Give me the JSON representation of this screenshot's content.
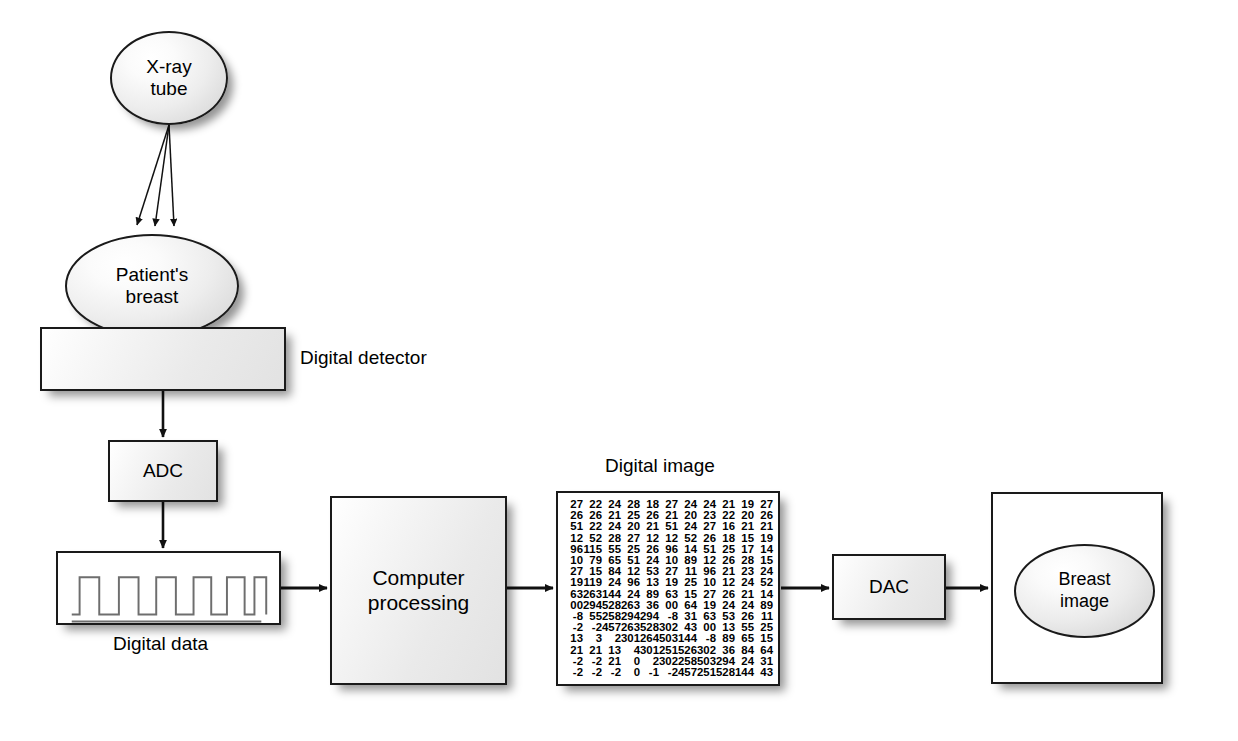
{
  "diagram": {
    "nodes": {
      "xray_tube": "X-ray\ntube",
      "patient_breast": "Patient's\nbreast",
      "digital_detector": "",
      "adc": "ADC",
      "computer_processing": "Computer\nprocessing",
      "dac": "DAC",
      "breast_image": "Breast\nimage"
    },
    "labels": {
      "digital_detector": "Digital detector",
      "digital_data": "Digital data",
      "digital_image": "Digital image"
    },
    "colors": {
      "stroke": "#1a1a1a",
      "fill_light": "#ffffff",
      "fill_grey": "#e2e2e2",
      "text": "#000000",
      "shadow": "rgba(0,0,0,0.42)"
    },
    "waveform": {
      "pulses": 7,
      "has_baseline": true
    },
    "beams": {
      "count": 3,
      "description": "three x-ray beams from tube to breast"
    }
  },
  "chart_data": {
    "type": "table",
    "title": "Digital image",
    "rows": 16,
    "columns": 11,
    "values": [
      [
        "27",
        "22",
        "24",
        "28",
        "18",
        "27",
        "24",
        "24",
        "21",
        "19",
        "27"
      ],
      [
        "26",
        "26",
        "21",
        "25",
        "26",
        "21",
        "20",
        "23",
        "22",
        "20",
        "26"
      ],
      [
        "51",
        "22",
        "24",
        "20",
        "21",
        "51",
        "24",
        "27",
        "16",
        "21",
        "21"
      ],
      [
        "12",
        "52",
        "28",
        "27",
        "12",
        "12",
        "52",
        "26",
        "18",
        "15",
        "19"
      ],
      [
        "96",
        "115",
        "55",
        "25",
        "26",
        "96",
        "14",
        "51",
        "25",
        "17",
        "14"
      ],
      [
        "10",
        "79",
        "65",
        "51",
        "24",
        "10",
        "89",
        "12",
        "26",
        "28",
        "15"
      ],
      [
        "27",
        "15",
        "84",
        "12",
        "53",
        "27",
        "11",
        "96",
        "21",
        "23",
        "24"
      ],
      [
        "19",
        "119",
        "24",
        "96",
        "13",
        "19",
        "25",
        "10",
        "12",
        "24",
        "52"
      ],
      [
        "63",
        "263",
        "144",
        "24",
        "89",
        "63",
        "15",
        "27",
        "26",
        "21",
        "14"
      ],
      [
        "00",
        "294",
        "528",
        "263",
        "36",
        "00",
        "64",
        "19",
        "24",
        "24",
        "89"
      ],
      [
        "-8",
        "55",
        "258",
        "294",
        "294",
        "-8",
        "31",
        "63",
        "53",
        "26",
        "11"
      ],
      [
        "-2",
        "-2",
        "457",
        "263",
        "528",
        "302",
        "43",
        "00",
        "13",
        "55",
        "25"
      ],
      [
        "13",
        "3",
        "2",
        "301",
        "264",
        "503",
        "144",
        "-8",
        "89",
        "65",
        "15"
      ],
      [
        "21",
        "21",
        "13",
        "4",
        "301",
        "251",
        "526",
        "302",
        "36",
        "84",
        "64"
      ],
      [
        "-2",
        "-2",
        "21",
        "0",
        "2",
        "302",
        "258",
        "503",
        "294",
        "24",
        "31"
      ],
      [
        "-2",
        "-2",
        "-2",
        "0",
        "-1",
        "-2",
        "457",
        "251",
        "528",
        "144",
        "43"
      ]
    ]
  }
}
